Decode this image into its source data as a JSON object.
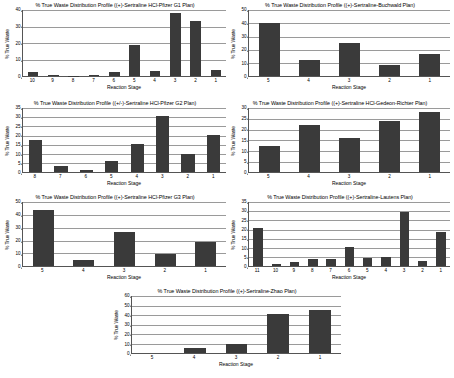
{
  "page": {
    "background": "#ffffff",
    "bar_color": "#3a3a3a",
    "grid_color": "#9a9a9a",
    "axis_color": "#555555"
  },
  "common": {
    "xlabel": "Reaction Stage",
    "ylabel": "% True Waste"
  },
  "chart_data": [
    {
      "id": "pfizer-g1",
      "type": "bar",
      "title": "% True Waste Distribution Profile ((+)-Sertraline HCl-Pfizer G1 Plan)",
      "xlabel": "Reaction Stage",
      "ylabel": "% True Waste",
      "categories": [
        "10",
        "9",
        "8",
        "7",
        "6",
        "5",
        "4",
        "3",
        "2",
        "1"
      ],
      "values": [
        2.7,
        0.6,
        0.1,
        0.9,
        2.3,
        19.2,
        3.0,
        38.5,
        33.5,
        3.7
      ],
      "ylim": [
        0,
        40
      ],
      "yticks": [
        0,
        10,
        20,
        30,
        40
      ],
      "grid": true
    },
    {
      "id": "buchwald",
      "type": "bar",
      "title": "% True Waste Distribution Profile ((+)-Sertraline-Buchwald Plan)",
      "xlabel": "Reaction Stage",
      "ylabel": "% True Waste",
      "categories": [
        "5",
        "4",
        "3",
        "2",
        "1"
      ],
      "values": [
        40.5,
        12.5,
        25.0,
        8.8,
        17.0
      ],
      "ylim": [
        0,
        50
      ],
      "yticks": [
        0,
        10,
        20,
        30,
        40,
        50
      ],
      "grid": true
    },
    {
      "id": "pfizer-g2",
      "type": "bar",
      "title": "% True Waste Distribution Profile ((+/-)-Sertraline HCl-Pfizer G2 Plan)",
      "xlabel": "Reaction Stage",
      "ylabel": "% True Waste",
      "categories": [
        "8",
        "7",
        "6",
        "5",
        "4",
        "3",
        "2",
        "1"
      ],
      "values": [
        17.5,
        3.5,
        1.0,
        6.0,
        15.2,
        30.5,
        10.0,
        20.3
      ],
      "ylim": [
        0,
        35
      ],
      "yticks": [
        0,
        5,
        10,
        15,
        20,
        25,
        30,
        35
      ],
      "grid": true
    },
    {
      "id": "gedeon-richter",
      "type": "bar",
      "title": "% True Waste Distribution Profile ((+)-Sertraline HCl-Gedeon-Richter Plan)",
      "xlabel": "Reaction Stage",
      "ylabel": "% True Waste",
      "categories": [
        "5",
        "4",
        "3",
        "2",
        "1"
      ],
      "values": [
        12.5,
        22.0,
        16.0,
        24.0,
        28.0
      ],
      "ylim": [
        0,
        30
      ],
      "yticks": [
        0,
        5,
        10,
        15,
        20,
        25,
        30
      ],
      "grid": true
    },
    {
      "id": "pfizer-g3",
      "type": "bar",
      "title": "% True Waste Distribution Profile ((+)-Sertraline HCl-Pfizer G3 Plan)",
      "xlabel": "Reaction Stage",
      "ylabel": "% True Waste",
      "categories": [
        "5",
        "4",
        "3",
        "2",
        "1"
      ],
      "values": [
        44.0,
        5.0,
        27.0,
        9.8,
        19.0
      ],
      "ylim": [
        0,
        50
      ],
      "yticks": [
        0,
        10,
        20,
        30,
        40,
        50
      ],
      "grid": true
    },
    {
      "id": "lautens",
      "type": "bar",
      "title": "% True Waste Distribution Profile ((+)-Sertraline-Lautens Plan)",
      "xlabel": "Reaction Stage",
      "ylabel": "% True Waste",
      "categories": [
        "11",
        "10",
        "9",
        "8",
        "7",
        "6",
        "5",
        "4",
        "3",
        "2",
        "1"
      ],
      "values": [
        21.0,
        1.0,
        2.5,
        4.2,
        4.0,
        10.5,
        4.5,
        5.0,
        29.5,
        3.0,
        18.5
      ],
      "ylim": [
        0,
        35
      ],
      "yticks": [
        0,
        5,
        10,
        15,
        20,
        25,
        30,
        35
      ],
      "grid": true
    },
    {
      "id": "zhao",
      "type": "bar",
      "title": "% True Waste Distribution Profile ((+)-Sertraline-Zhao Plan)",
      "xlabel": "Reaction Stage",
      "ylabel": "% True Waste",
      "categories": [
        "5",
        "4",
        "3",
        "2",
        "1"
      ],
      "values": [
        0,
        6.0,
        9.5,
        41.0,
        45.0
      ],
      "ylim": [
        0,
        60
      ],
      "yticks": [
        0,
        10,
        20,
        30,
        40,
        50,
        60
      ],
      "grid": true
    }
  ]
}
